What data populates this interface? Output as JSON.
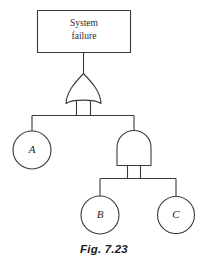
{
  "figure": {
    "caption": "Fig. 7.23",
    "background_color": "#ffffff",
    "line_color": "#3a3a3a",
    "diagram_type": "fault-tree"
  },
  "top_event": {
    "shape": "rectangle",
    "label_line_1": "System",
    "label_line_2": "failure"
  },
  "gates": [
    {
      "id": "gate-or-1",
      "type": "OR",
      "symbol_name": "or-gate-symbol",
      "output_to": "top_event",
      "inputs": [
        "event-a",
        "gate-and-1"
      ]
    },
    {
      "id": "gate-and-1",
      "type": "AND",
      "symbol_name": "and-gate-symbol",
      "output_to": "gate-or-1",
      "inputs": [
        "event-b",
        "event-c"
      ]
    }
  ],
  "basic_events": [
    {
      "id": "event-a",
      "label": "A",
      "shape": "circle"
    },
    {
      "id": "event-b",
      "label": "B",
      "shape": "circle"
    },
    {
      "id": "event-c",
      "label": "C",
      "shape": "circle"
    }
  ]
}
